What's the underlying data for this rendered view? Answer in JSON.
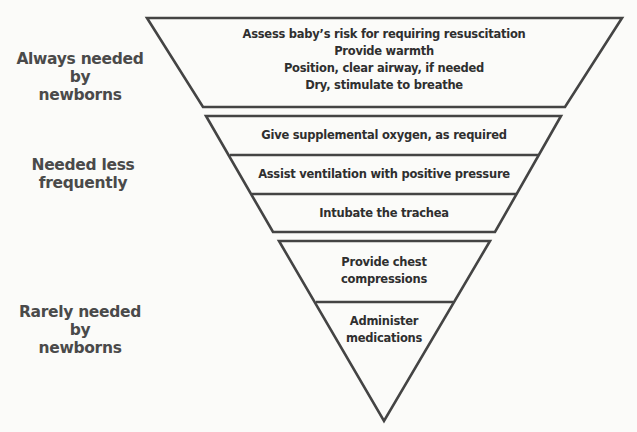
{
  "diagram": {
    "type": "inverted-pyramid",
    "stroke_color": "#444444",
    "fill_color": "#fbfbf9",
    "side_labels": [
      {
        "text_line1": "Always needed by",
        "text_line2": "newborns"
      },
      {
        "text_line1": "Needed less",
        "text_line2": "frequently"
      },
      {
        "text_line1": "Rarely needed by",
        "text_line2": "newborns"
      }
    ],
    "sections": [
      {
        "name": "always",
        "steps": [
          {
            "lines": [
              "Assess baby’s risk for requiring resuscitation",
              "Provide warmth",
              "Position, clear airway, if needed",
              "Dry, stimulate to breathe"
            ]
          }
        ]
      },
      {
        "name": "less-frequent",
        "steps": [
          {
            "lines": [
              "Give supplemental oxygen, as required"
            ]
          },
          {
            "lines": [
              "Assist ventilation with positive pressure"
            ]
          },
          {
            "lines": [
              "Intubate the trachea"
            ]
          }
        ]
      },
      {
        "name": "rarely",
        "steps": [
          {
            "lines": [
              "Provide chest",
              "compressions"
            ]
          },
          {
            "lines": [
              "Administer",
              "medications"
            ]
          }
        ]
      }
    ]
  }
}
